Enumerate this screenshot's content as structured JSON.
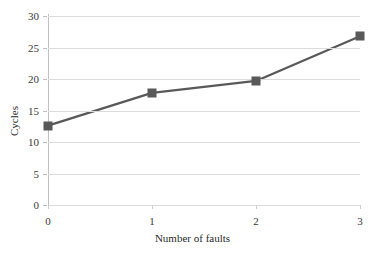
{
  "chart_data": {
    "type": "line",
    "title": "",
    "xlabel": "Number of faults",
    "ylabel": "Cycles",
    "x": [
      0,
      1,
      2,
      3
    ],
    "categories": [
      "0",
      "1",
      "2",
      "3"
    ],
    "values": [
      12.6,
      17.8,
      19.7,
      26.8
    ],
    "series": [
      {
        "name": "Cycles",
        "values": [
          12.6,
          17.8,
          19.7,
          26.8
        ],
        "color": "#595959",
        "marker": "square",
        "line_width": 2.2
      }
    ],
    "xlim": [
      0,
      3
    ],
    "ylim": [
      0,
      30
    ],
    "yticks": [
      0,
      5,
      10,
      15,
      20,
      25,
      30
    ],
    "ytick_labels": [
      "0",
      "5",
      "10",
      "15",
      "20",
      "25",
      "30"
    ],
    "xticks": [
      0,
      1,
      2,
      3
    ],
    "xtick_labels": [
      "0",
      "1",
      "2",
      "3"
    ],
    "grid": "horizontal",
    "grid_color": "#dcdcdc",
    "legend": "none",
    "background": "#ffffff"
  }
}
